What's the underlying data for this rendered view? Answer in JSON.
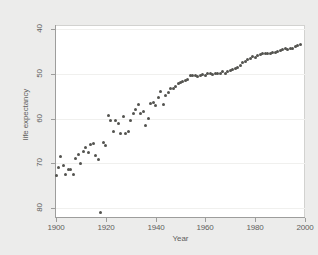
{
  "chart_data": {
    "type": "scatter",
    "title": "",
    "xlabel": "Year",
    "ylabel": "life expectancy",
    "xlim": [
      1900,
      2000
    ],
    "ylim": [
      38,
      81
    ],
    "xticks": [
      1900,
      1920,
      1940,
      1960,
      1980,
      2000
    ],
    "yticks": [
      40,
      50,
      60,
      70,
      80
    ],
    "grid": true,
    "legend": null,
    "marker_color": "#53534f",
    "plot_background": "#ffffff",
    "figure_background": "#ececeb",
    "axis_color": "#9d9d9c",
    "annotations": [
      {
        "x": 1918,
        "y": 39.1,
        "note": "influenza pandemic outlier"
      }
    ],
    "x": [
      1900,
      1901,
      1902,
      1903,
      1904,
      1905,
      1906,
      1907,
      1908,
      1909,
      1910,
      1911,
      1912,
      1913,
      1914,
      1915,
      1916,
      1917,
      1918,
      1919,
      1920,
      1921,
      1922,
      1923,
      1924,
      1925,
      1926,
      1927,
      1928,
      1929,
      1930,
      1931,
      1932,
      1933,
      1934,
      1935,
      1936,
      1937,
      1938,
      1939,
      1940,
      1941,
      1942,
      1943,
      1944,
      1945,
      1946,
      1947,
      1948,
      1949,
      1950,
      1951,
      1952,
      1953,
      1954,
      1955,
      1956,
      1957,
      1958,
      1959,
      1960,
      1961,
      1962,
      1963,
      1964,
      1965,
      1966,
      1967,
      1968,
      1969,
      1970,
      1971,
      1972,
      1973,
      1974,
      1975,
      1976,
      1977,
      1978,
      1979,
      1980,
      1981,
      1982,
      1983,
      1984,
      1985,
      1986,
      1987,
      1988,
      1989,
      1990,
      1991,
      1992,
      1993,
      1994,
      1995,
      1996,
      1997,
      1998
    ],
    "y": [
      47.3,
      49.1,
      51.5,
      49.5,
      47.6,
      48.7,
      48.7,
      47.6,
      51.1,
      52.1,
      50.0,
      52.6,
      53.5,
      52.5,
      54.2,
      54.5,
      51.7,
      50.9,
      39.1,
      54.7,
      54.1,
      60.8,
      59.6,
      57.2,
      59.7,
      59.0,
      56.7,
      60.4,
      56.8,
      57.1,
      59.7,
      61.1,
      62.1,
      63.3,
      61.1,
      61.7,
      58.5,
      60.0,
      63.5,
      63.7,
      62.9,
      64.8,
      66.2,
      63.3,
      65.2,
      65.9,
      66.7,
      66.8,
      67.2,
      68.0,
      68.2,
      68.4,
      68.6,
      68.8,
      69.6,
      69.6,
      69.7,
      69.5,
      69.6,
      69.9,
      69.7,
      70.2,
      70.1,
      69.9,
      70.2,
      70.2,
      70.2,
      70.5,
      70.2,
      70.5,
      70.8,
      71.1,
      71.2,
      71.4,
      72.0,
      72.6,
      72.9,
      73.3,
      73.5,
      73.9,
      73.7,
      74.1,
      74.5,
      74.6,
      74.7,
      74.7,
      74.7,
      74.9,
      74.9,
      75.1,
      75.4,
      75.5,
      75.8,
      75.5,
      75.7,
      75.8,
      76.1,
      76.5,
      76.7
    ]
  },
  "axes": {
    "ytick_labels": [
      "80",
      "70",
      "60",
      "50",
      "40"
    ],
    "xtick_labels": [
      "1900",
      "1920",
      "1940",
      "1960",
      "1980",
      "2000"
    ],
    "ylabel": "life expectancy",
    "xlabel": "Year"
  }
}
